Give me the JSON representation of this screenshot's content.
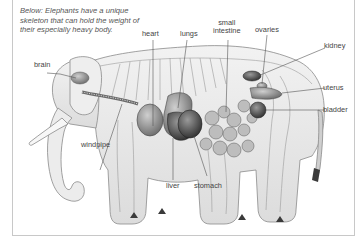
{
  "figure": {
    "caption": "Below: Elephants have a unique skeleton that can hold the weight of their especially heavy body.",
    "colors": {
      "frame": "#c8c8c8",
      "text": "#444444",
      "caption": "#555555",
      "line": "#555555",
      "organ_dark": "#3a3a3a",
      "organ_mid": "#7a7a7a",
      "skin": "#e6e6e6"
    }
  },
  "labels": {
    "heart": "heart",
    "lungs": "lungs",
    "small_intestine_line1": "small",
    "small_intestine_line2": "intestine",
    "ovaries": "ovaries",
    "kidney": "kidney",
    "brain": "brain",
    "uterus": "uterus",
    "bladder": "bladder",
    "windpipe": "windpipe",
    "liver": "liver",
    "stomach": "stomach"
  }
}
